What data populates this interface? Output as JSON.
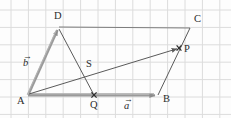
{
  "figure": {
    "kind": "vector-geometry-diagram",
    "background_color": "#fdfdfd",
    "grid": {
      "visible": true,
      "color": "#dcdcdc",
      "spacing_px": 17.4,
      "origin_x": 11,
      "origin_y": 10
    },
    "stroke_colors": {
      "thin_line": "#5a5a5a",
      "thick_vector": "#8c8c8c",
      "marker": "#333333"
    },
    "points": [
      {
        "name": "A",
        "label": "A",
        "x": 28,
        "y": 95,
        "label_x": 17,
        "label_y": 96,
        "marker": "none"
      },
      {
        "name": "D",
        "label": "D",
        "x": 58,
        "y": 27,
        "label_x": 54,
        "label_y": 11,
        "marker": "none"
      },
      {
        "name": "Q",
        "label": "Q",
        "x": 94,
        "y": 95,
        "label_x": 90,
        "label_y": 100,
        "marker": "cross"
      },
      {
        "name": "B",
        "label": "B",
        "x": 158,
        "y": 95,
        "label_x": 163,
        "label_y": 94,
        "marker": "none"
      },
      {
        "name": "C",
        "label": "C",
        "x": 190,
        "y": 28,
        "label_x": 194,
        "label_y": 14,
        "marker": "none"
      },
      {
        "name": "P",
        "label": "P",
        "x": 179,
        "y": 48,
        "label_x": 184,
        "label_y": 44,
        "marker": "cross"
      },
      {
        "name": "S",
        "label": "S",
        "x": 85,
        "y": 72,
        "label_x": 86,
        "label_y": 59,
        "marker": "none"
      }
    ],
    "vectors": [
      {
        "name": "vector-b",
        "label": "b",
        "from": "A",
        "to": "D",
        "label_x": 23,
        "label_y": 57,
        "style": "thick-arrow"
      },
      {
        "name": "vector-a",
        "label": "a",
        "from": "A",
        "to": "B",
        "label_x": 124,
        "label_y": 100,
        "style": "thick-arrow"
      }
    ],
    "segments": [
      {
        "name": "segment-D-C",
        "from": "D",
        "to": "C",
        "style": "thin"
      },
      {
        "name": "segment-D-Q",
        "from": "D",
        "to": "Q",
        "style": "thin"
      },
      {
        "name": "segment-A-P",
        "from": "A",
        "to": "P",
        "style": "thin-arrow"
      },
      {
        "name": "segment-B-C",
        "from": "B",
        "to": "C",
        "style": "thin"
      },
      {
        "name": "segment-A-Q",
        "from": "A",
        "to": "Q",
        "style": "thin"
      }
    ],
    "arrow_overscore": "→"
  }
}
